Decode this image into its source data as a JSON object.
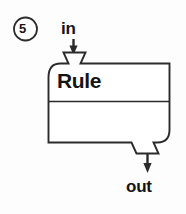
{
  "diagram": {
    "marker": {
      "label": "5",
      "shape": "circle"
    },
    "block": {
      "label": "Rule",
      "upper_section_label": "Rule",
      "lower_section_label": ""
    },
    "ports": [
      {
        "name": "input-port",
        "label": "in",
        "position": "top-left",
        "arrow_direction": "down"
      },
      {
        "name": "output-port",
        "label": "out",
        "position": "bottom-right",
        "arrow_direction": "down"
      }
    ],
    "colors": {
      "stroke": "#2b2b2b",
      "text": "#141414",
      "background": "#fdfdfd",
      "fill": "#ffffff"
    }
  }
}
